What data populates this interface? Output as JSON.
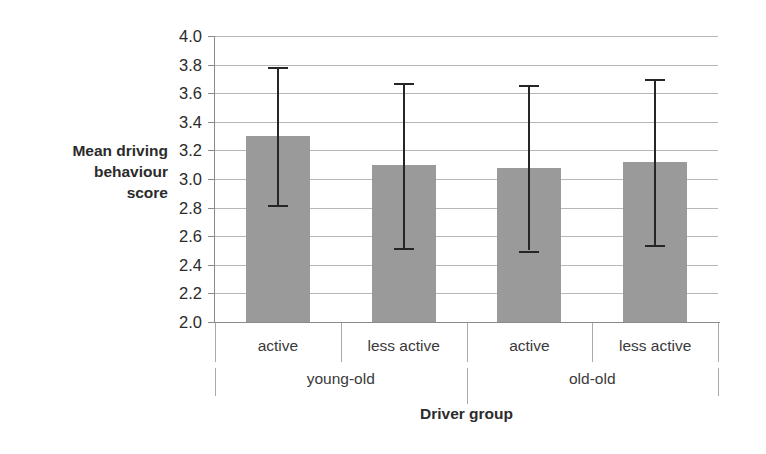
{
  "chart_data": {
    "type": "bar",
    "title": "",
    "xlabel": "Driver group",
    "ylabel": "Mean driving behaviour score",
    "ylabel_lines": [
      "Mean driving",
      "behaviour",
      "score"
    ],
    "ylim": [
      2.0,
      4.0
    ],
    "ytick_step": 0.2,
    "yticks": [
      "4.0",
      "3.8",
      "3.6",
      "3.4",
      "3.2",
      "3.0",
      "2.8",
      "2.6",
      "2.4",
      "2.2",
      "2.0"
    ],
    "ytick_values": [
      4.0,
      3.8,
      3.6,
      3.4,
      3.2,
      3.0,
      2.8,
      2.6,
      2.4,
      2.2,
      2.0
    ],
    "grid": true,
    "legend": false,
    "bar_color": "#9a9a9a",
    "errorbar_color": "#262626",
    "gridline_color": "#b7b7b7",
    "categories": [
      "active",
      "less active",
      "active",
      "less active"
    ],
    "groups": [
      {
        "label": "young-old",
        "span": 2
      },
      {
        "label": "old-old",
        "span": 2
      }
    ],
    "values": [
      3.3,
      3.1,
      3.08,
      3.12
    ],
    "error_upper": [
      3.78,
      3.67,
      3.66,
      3.7
    ],
    "error_lower": [
      2.82,
      2.52,
      2.5,
      2.54
    ],
    "points": [
      {
        "category": "active",
        "group": "young-old",
        "mean": 3.3,
        "upper": 3.78,
        "lower": 2.82
      },
      {
        "category": "less active",
        "group": "young-old",
        "mean": 3.1,
        "upper": 3.67,
        "lower": 2.52
      },
      {
        "category": "active",
        "group": "old-old",
        "mean": 3.08,
        "upper": 3.66,
        "lower": 2.5
      },
      {
        "category": "less active",
        "group": "old-old",
        "mean": 3.12,
        "upper": 3.7,
        "lower": 2.54
      }
    ]
  }
}
